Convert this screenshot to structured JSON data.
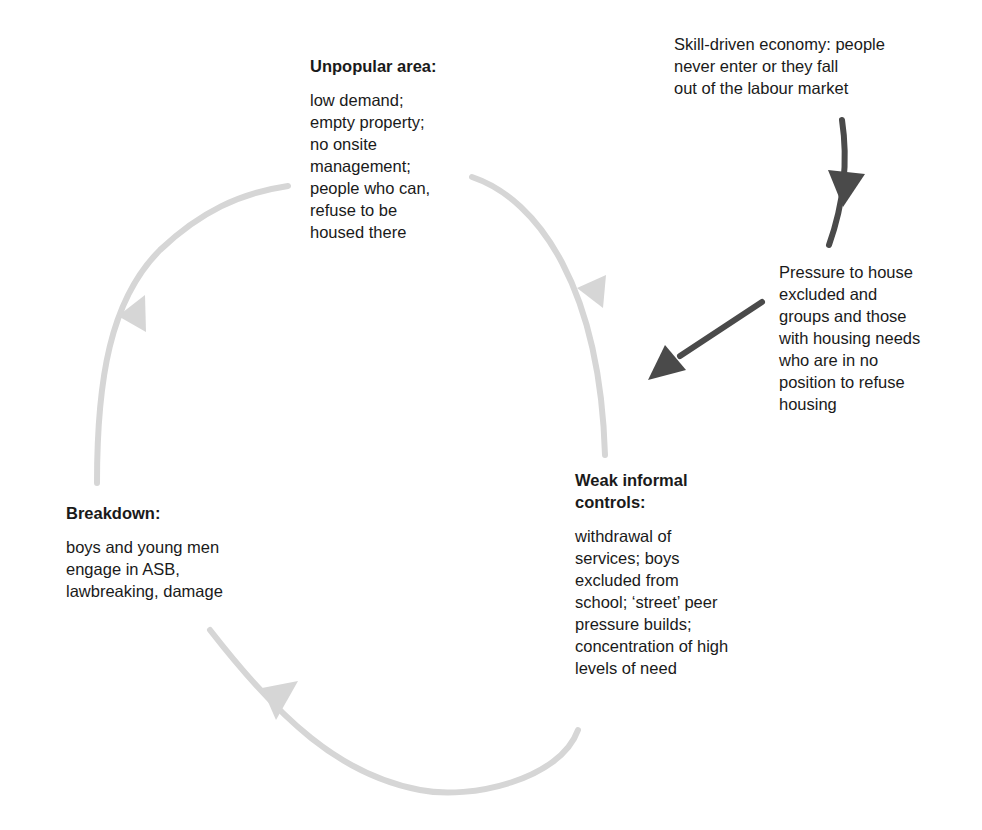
{
  "diagram": {
    "type": "cycle",
    "nodes": [
      {
        "id": "unpopular",
        "title": "Unpopular area:",
        "body": "low demand;\nempty property;\nno onsite\nmanagement;\npeople who can,\nrefuse to be\nhoused there"
      },
      {
        "id": "weak",
        "title": "Weak informal\ncontrols:",
        "body": "withdrawal of\nservices; boys\nexcluded from\nschool; ‘street’ peer\npressure builds;\nconcentration of high\nlevels of need"
      },
      {
        "id": "breakdown",
        "title": "Breakdown:",
        "body": "boys and young men\nengage in ASB,\nlawbreaking, damage"
      }
    ],
    "external": [
      {
        "id": "economy",
        "text": "Skill-driven economy: people\nnever enter or they fall\nout of the labour market"
      },
      {
        "id": "pressure",
        "text": "Pressure to house\nexcluded and\ngroups and those\nwith housing needs\nwho are in no\nposition to refuse\nhousing"
      }
    ],
    "edges": [
      {
        "from": "unpopular",
        "to": "weak",
        "style": "light-gray curved"
      },
      {
        "from": "weak",
        "to": "breakdown",
        "style": "light-gray curved"
      },
      {
        "from": "breakdown",
        "to": "unpopular",
        "style": "light-gray curved"
      },
      {
        "from": "economy",
        "to": "pressure",
        "style": "dark-gray"
      },
      {
        "from": "pressure",
        "to": "weak",
        "style": "dark-gray"
      }
    ],
    "colors": {
      "cycle_arrow": "#d6d6d6",
      "driver_arrow": "#4a4a4a",
      "text": "#1a1a1a"
    }
  }
}
